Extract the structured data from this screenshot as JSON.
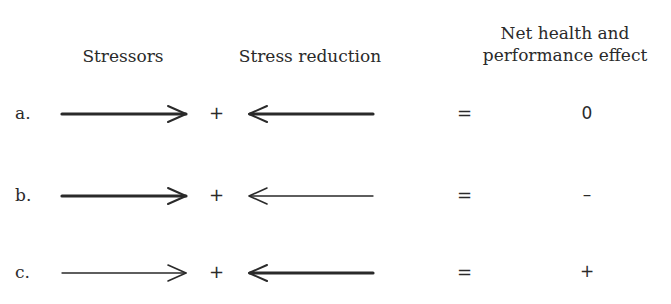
{
  "headers": {
    "stressors": "Stressors",
    "stress_reduction": "Stress reduction",
    "net_effect_line1": "Net health and",
    "net_effect_line2": "performance effect"
  },
  "rows": [
    {
      "label": "a.",
      "stressor_strength": "strong",
      "reduction_strength": "strong",
      "plus": "+",
      "equals": "=",
      "result": "0"
    },
    {
      "label": "b.",
      "stressor_strength": "strong",
      "reduction_strength": "weak",
      "plus": "+",
      "equals": "=",
      "result": "–"
    },
    {
      "label": "c.",
      "stressor_strength": "weak",
      "reduction_strength": "strong",
      "plus": "+",
      "equals": "=",
      "result": "+"
    }
  ],
  "colors": {
    "ink": "#2a2a2a",
    "background": "#ffffff"
  }
}
